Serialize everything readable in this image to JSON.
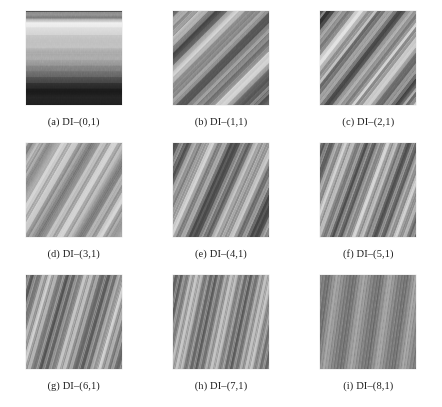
{
  "figure": {
    "type": "texture-sample-grid",
    "rows": 3,
    "columns": 3,
    "background_color": "#ffffff",
    "text_color": "#232323",
    "panel_width_px": 96,
    "panel_height_px": 94
  },
  "panels": [
    {
      "id": "panel-a",
      "label": "(a)",
      "name": "DI–(0,1)",
      "caption": "(a)  DI–(0,1)",
      "orientation_deg": 90,
      "stripe_period_px": 96,
      "description": "vertical bands, bright at left fading to dark at right",
      "stops": [
        {
          "offset": 0.0,
          "gray": 128
        },
        {
          "offset": 0.04,
          "gray": 150
        },
        {
          "offset": 0.07,
          "gray": 110
        },
        {
          "offset": 0.11,
          "gray": 246
        },
        {
          "offset": 0.16,
          "gray": 232
        },
        {
          "offset": 0.24,
          "gray": 205
        },
        {
          "offset": 0.31,
          "gray": 186
        },
        {
          "offset": 0.38,
          "gray": 196
        },
        {
          "offset": 0.44,
          "gray": 158
        },
        {
          "offset": 0.5,
          "gray": 178
        },
        {
          "offset": 0.56,
          "gray": 140
        },
        {
          "offset": 0.62,
          "gray": 120
        },
        {
          "offset": 0.68,
          "gray": 96
        },
        {
          "offset": 0.74,
          "gray": 62
        },
        {
          "offset": 0.8,
          "gray": 34
        },
        {
          "offset": 0.86,
          "gray": 22
        },
        {
          "offset": 0.92,
          "gray": 40
        },
        {
          "offset": 1.0,
          "gray": 28
        }
      ]
    },
    {
      "id": "panel-b",
      "label": "(b)",
      "name": "DI–(1,1)",
      "caption": "(b)  DI–(1,1)",
      "orientation_deg": 45,
      "stripe_period_px": 58,
      "description": "broad 45-degree diagonal bands, high contrast",
      "stops": [
        {
          "offset": 0.0,
          "gray": 70
        },
        {
          "offset": 0.06,
          "gray": 150
        },
        {
          "offset": 0.12,
          "gray": 232
        },
        {
          "offset": 0.17,
          "gray": 120
        },
        {
          "offset": 0.23,
          "gray": 60
        },
        {
          "offset": 0.3,
          "gray": 140
        },
        {
          "offset": 0.36,
          "gray": 244
        },
        {
          "offset": 0.42,
          "gray": 200
        },
        {
          "offset": 0.5,
          "gray": 96
        },
        {
          "offset": 0.58,
          "gray": 46
        },
        {
          "offset": 0.65,
          "gray": 130
        },
        {
          "offset": 0.72,
          "gray": 238
        },
        {
          "offset": 0.79,
          "gray": 186
        },
        {
          "offset": 0.86,
          "gray": 88
        },
        {
          "offset": 0.93,
          "gray": 44
        },
        {
          "offset": 1.0,
          "gray": 110
        }
      ]
    },
    {
      "id": "panel-c",
      "label": "(c)",
      "name": "DI–(2,1)",
      "caption": "(c)  DI–(2,1)",
      "orientation_deg": 38,
      "stripe_period_px": 40,
      "description": "diagonal bands, slightly narrower period than (b)",
      "stops": [
        {
          "offset": 0.0,
          "gray": 60
        },
        {
          "offset": 0.08,
          "gray": 40
        },
        {
          "offset": 0.16,
          "gray": 150
        },
        {
          "offset": 0.24,
          "gray": 240
        },
        {
          "offset": 0.32,
          "gray": 196
        },
        {
          "offset": 0.4,
          "gray": 110
        },
        {
          "offset": 0.48,
          "gray": 52
        },
        {
          "offset": 0.56,
          "gray": 140
        },
        {
          "offset": 0.64,
          "gray": 242
        },
        {
          "offset": 0.72,
          "gray": 190
        },
        {
          "offset": 0.8,
          "gray": 100
        },
        {
          "offset": 0.88,
          "gray": 48
        },
        {
          "offset": 0.94,
          "gray": 160
        },
        {
          "offset": 1.0,
          "gray": 230
        }
      ]
    },
    {
      "id": "panel-d",
      "label": "(d)",
      "name": "DI–(3,1)",
      "caption": "(d)  DI–(3,1)",
      "orientation_deg": 30,
      "stripe_period_px": 34,
      "description": "shallower diagonal bands with thin dark lines",
      "stops": [
        {
          "offset": 0.0,
          "gray": 210
        },
        {
          "offset": 0.05,
          "gray": 96
        },
        {
          "offset": 0.1,
          "gray": 215
        },
        {
          "offset": 0.15,
          "gray": 92
        },
        {
          "offset": 0.22,
          "gray": 200
        },
        {
          "offset": 0.3,
          "gray": 228
        },
        {
          "offset": 0.38,
          "gray": 150
        },
        {
          "offset": 0.44,
          "gray": 78
        },
        {
          "offset": 0.5,
          "gray": 168
        },
        {
          "offset": 0.58,
          "gray": 224
        },
        {
          "offset": 0.66,
          "gray": 186
        },
        {
          "offset": 0.72,
          "gray": 80
        },
        {
          "offset": 0.78,
          "gray": 150
        },
        {
          "offset": 0.86,
          "gray": 226
        },
        {
          "offset": 0.93,
          "gray": 120
        },
        {
          "offset": 1.0,
          "gray": 196
        }
      ]
    },
    {
      "id": "panel-e",
      "label": "(e)",
      "name": "DI–(4,1)",
      "caption": "(e)  DI–(4,1)",
      "orientation_deg": 24,
      "stripe_period_px": 28,
      "description": "regular shallow diagonal banding, medium contrast",
      "stops": [
        {
          "offset": 0.0,
          "gray": 86
        },
        {
          "offset": 0.08,
          "gray": 60
        },
        {
          "offset": 0.16,
          "gray": 130
        },
        {
          "offset": 0.24,
          "gray": 238
        },
        {
          "offset": 0.32,
          "gray": 190
        },
        {
          "offset": 0.42,
          "gray": 78
        },
        {
          "offset": 0.5,
          "gray": 62
        },
        {
          "offset": 0.58,
          "gray": 140
        },
        {
          "offset": 0.66,
          "gray": 240
        },
        {
          "offset": 0.74,
          "gray": 180
        },
        {
          "offset": 0.84,
          "gray": 74
        },
        {
          "offset": 0.92,
          "gray": 58
        },
        {
          "offset": 1.0,
          "gray": 150
        }
      ]
    },
    {
      "id": "panel-f",
      "label": "(f)",
      "name": "DI–(5,1)",
      "caption": "(f)  DI–(5,1)",
      "orientation_deg": 20,
      "stripe_period_px": 24,
      "description": "shallow diagonal bands, period shorter than (e)",
      "stops": [
        {
          "offset": 0.0,
          "gray": 110
        },
        {
          "offset": 0.07,
          "gray": 64
        },
        {
          "offset": 0.14,
          "gray": 150
        },
        {
          "offset": 0.21,
          "gray": 236
        },
        {
          "offset": 0.28,
          "gray": 160
        },
        {
          "offset": 0.36,
          "gray": 66
        },
        {
          "offset": 0.44,
          "gray": 96
        },
        {
          "offset": 0.52,
          "gray": 232
        },
        {
          "offset": 0.6,
          "gray": 170
        },
        {
          "offset": 0.68,
          "gray": 62
        },
        {
          "offset": 0.76,
          "gray": 100
        },
        {
          "offset": 0.84,
          "gray": 234
        },
        {
          "offset": 0.92,
          "gray": 150
        },
        {
          "offset": 1.0,
          "gray": 70
        }
      ]
    },
    {
      "id": "panel-g",
      "label": "(g)",
      "name": "DI–(6,1)",
      "caption": "(g)  DI–(6,1)",
      "orientation_deg": 16,
      "stripe_period_px": 20,
      "description": "near-horizontal banding with fine vertical micro-texture",
      "stops": [
        {
          "offset": 0.0,
          "gray": 120
        },
        {
          "offset": 0.06,
          "gray": 70
        },
        {
          "offset": 0.13,
          "gray": 160
        },
        {
          "offset": 0.2,
          "gray": 230
        },
        {
          "offset": 0.27,
          "gray": 140
        },
        {
          "offset": 0.34,
          "gray": 68
        },
        {
          "offset": 0.42,
          "gray": 110
        },
        {
          "offset": 0.5,
          "gray": 228
        },
        {
          "offset": 0.58,
          "gray": 150
        },
        {
          "offset": 0.65,
          "gray": 66
        },
        {
          "offset": 0.73,
          "gray": 118
        },
        {
          "offset": 0.81,
          "gray": 230
        },
        {
          "offset": 0.89,
          "gray": 144
        },
        {
          "offset": 1.0,
          "gray": 72
        }
      ]
    },
    {
      "id": "panel-h",
      "label": "(h)",
      "name": "DI–(7,1)",
      "caption": "(h)  DI–(7,1)",
      "orientation_deg": 12,
      "stripe_period_px": 17,
      "description": "tight near-horizontal banding, strong vertical striation",
      "stops": [
        {
          "offset": 0.0,
          "gray": 96
        },
        {
          "offset": 0.07,
          "gray": 74
        },
        {
          "offset": 0.15,
          "gray": 180
        },
        {
          "offset": 0.22,
          "gray": 222
        },
        {
          "offset": 0.29,
          "gray": 120
        },
        {
          "offset": 0.37,
          "gray": 72
        },
        {
          "offset": 0.45,
          "gray": 150
        },
        {
          "offset": 0.52,
          "gray": 224
        },
        {
          "offset": 0.6,
          "gray": 128
        },
        {
          "offset": 0.67,
          "gray": 70
        },
        {
          "offset": 0.75,
          "gray": 156
        },
        {
          "offset": 0.83,
          "gray": 224
        },
        {
          "offset": 0.91,
          "gray": 124
        },
        {
          "offset": 1.0,
          "gray": 76
        }
      ]
    },
    {
      "id": "panel-i",
      "label": "(i)",
      "name": "DI–(8,1)",
      "caption": "(i)  DI–(8,1)",
      "orientation_deg": 8,
      "stripe_period_px": 12,
      "description": "very fine dense horizontal banding with vertical grid texture",
      "stops": [
        {
          "offset": 0.0,
          "gray": 130
        },
        {
          "offset": 0.08,
          "gray": 90
        },
        {
          "offset": 0.16,
          "gray": 185
        },
        {
          "offset": 0.24,
          "gray": 118
        },
        {
          "offset": 0.32,
          "gray": 92
        },
        {
          "offset": 0.4,
          "gray": 188
        },
        {
          "offset": 0.48,
          "gray": 122
        },
        {
          "offset": 0.56,
          "gray": 90
        },
        {
          "offset": 0.64,
          "gray": 190
        },
        {
          "offset": 0.72,
          "gray": 120
        },
        {
          "offset": 0.8,
          "gray": 92
        },
        {
          "offset": 0.88,
          "gray": 186
        },
        {
          "offset": 0.96,
          "gray": 124
        },
        {
          "offset": 1.0,
          "gray": 100
        }
      ]
    }
  ]
}
